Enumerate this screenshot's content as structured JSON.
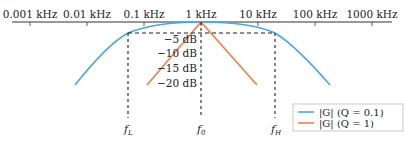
{
  "chart_data": {
    "type": "line",
    "title": "",
    "xlabel": "frequency (log scale)",
    "ylabel": "gain |G| (dB)",
    "x_scale": "log",
    "x_ticks": [
      "0.001 kHz",
      "0.01 kHz",
      "0.1 kHz",
      "1 kHz",
      "10 kHz",
      "100 kHz",
      "1000 kHz"
    ],
    "x_tick_values_khz": [
      0.001,
      0.01,
      0.1,
      1,
      10,
      100,
      1000
    ],
    "y_ticks": [
      "−5 dB",
      "−10 dB",
      "−15 dB",
      "−20 dB"
    ],
    "y_tick_values_db": [
      -5,
      -10,
      -15,
      -20
    ],
    "ylim": [
      -20,
      0
    ],
    "axis_position": "top",
    "grid": false,
    "markers": [
      {
        "name": "f_L",
        "label": "f",
        "sub": "L",
        "freq_khz": 0.18
      },
      {
        "name": "f_0",
        "label": "f",
        "sub": "0",
        "freq_khz": 1
      },
      {
        "name": "f_H",
        "label": "f",
        "sub": "H",
        "freq_khz": 20
      }
    ],
    "reference_line_db": -3,
    "series": [
      {
        "name": "|G| (Q = 0.1)",
        "color": "#4aa8e0",
        "x_khz": [
          0.02,
          0.05,
          0.1,
          0.18,
          0.3,
          0.6,
          1,
          2,
          5,
          10,
          20,
          40,
          80,
          110
        ],
        "y_db": [
          -20,
          -13,
          -7,
          -3,
          -1.5,
          -0.5,
          0,
          -0.3,
          -0.8,
          -1.5,
          -3,
          -7,
          -13,
          -20
        ]
      },
      {
        "name": "|G| (Q = 1)",
        "color": "#f07f45",
        "x_khz": [
          0.11,
          1,
          9
        ],
        "y_db": [
          -20,
          0,
          -20
        ]
      }
    ],
    "legend": {
      "position": "lower right",
      "entries": [
        {
          "label": "|G|  (Q = 0.1)",
          "color": "#4aa8e0"
        },
        {
          "label": "|G|  (Q = 1)",
          "color": "#f07f45"
        }
      ]
    }
  },
  "axis": {
    "ticks": [
      {
        "label": "0.001 kHz",
        "x": 30
      },
      {
        "label": "0.01 kHz",
        "x": 87
      },
      {
        "label": "0.1 kHz",
        "x": 144
      },
      {
        "label": "1 kHz",
        "x": 201
      },
      {
        "label": "10 kHz",
        "x": 258
      },
      {
        "label": "100 kHz",
        "x": 315
      },
      {
        "label": "1000 kHz",
        "x": 372
      }
    ]
  },
  "db_labels": [
    {
      "label": "−5 dB",
      "y": 43
    },
    {
      "label": "−10 dB",
      "y": 57
    },
    {
      "label": "−15 dB",
      "y": 72
    },
    {
      "label": "−20 dB",
      "y": 87
    }
  ],
  "markers": [
    {
      "main": "f",
      "sub": "L",
      "x": 128
    },
    {
      "main": "f",
      "sub": "0",
      "x": 201
    },
    {
      "main": "f",
      "sub": "H",
      "x": 275
    }
  ],
  "legend": {
    "entries": [
      {
        "label": "|G|  (Q = 0.1)",
        "color": "#4aa8e0"
      },
      {
        "label": "|G|  (Q = 1)",
        "color": "#f07f45"
      }
    ]
  },
  "colors": {
    "blue": "#4aa8e0",
    "orange": "#f07f45",
    "axis": "#333333",
    "dash": "#222222"
  }
}
